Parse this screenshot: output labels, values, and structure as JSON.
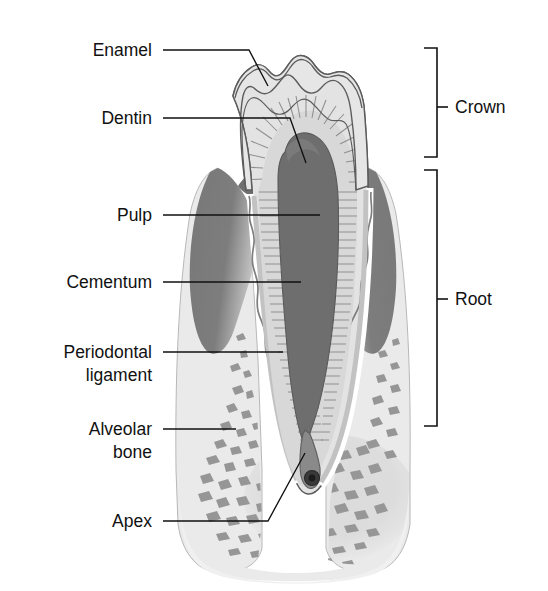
{
  "figure": {
    "type": "anatomical-diagram",
    "background_color": "#ffffff"
  },
  "labels_left": [
    {
      "id": "enamel",
      "text": "Enamel",
      "text_x": 152,
      "text_y": 56,
      "lines": []
    },
    {
      "id": "dentin",
      "text": "Dentin",
      "text_x": 152,
      "text_y": 124,
      "lines": []
    },
    {
      "id": "pulp",
      "text": "Pulp",
      "text_x": 152,
      "text_y": 221,
      "lines": []
    },
    {
      "id": "cementum",
      "text": "Cementum",
      "text_x": 152,
      "text_y": 288,
      "lines": []
    },
    {
      "id": "periodontal-ligament",
      "text": "Periodontal",
      "text_x": 152,
      "text_y": 358,
      "lines": [
        {
          "text": "ligament",
          "x": 152,
          "y": 381
        }
      ]
    },
    {
      "id": "alveolar-bone",
      "text": "Alveolar",
      "text_x": 152,
      "text_y": 435,
      "lines": [
        {
          "text": "bone",
          "x": 152,
          "y": 458
        }
      ]
    },
    {
      "id": "apex",
      "text": "Apex",
      "text_x": 152,
      "text_y": 527,
      "lines": []
    }
  ],
  "labels_right": [
    {
      "id": "crown",
      "text": "Crown",
      "text_x": 455,
      "text_y": 113
    },
    {
      "id": "root",
      "text": "Root",
      "text_x": 455,
      "text_y": 305
    }
  ],
  "brackets": [
    {
      "id": "crown-bracket",
      "top": 48,
      "bottom": 157,
      "x": 437,
      "tick_y": 107
    },
    {
      "id": "root-bracket",
      "top": 170,
      "bottom": 426,
      "x": 437,
      "tick_y": 299
    }
  ],
  "colors": {
    "outline": "#5c5c5c",
    "text": "#111111",
    "enamel": "#dddddd",
    "dentin": "#d2d2d2",
    "dentin_hatch": "#8f8f8f",
    "pulp": "#6e6e6e",
    "gingiva": "#7a7a7a",
    "gingiva_dark": "#6a6a6a",
    "bone": "#e7e7e7",
    "trabecula": "#8b8b8b",
    "cementum": "#c9c9c9",
    "pdl": "#9a9a9a",
    "canal": "#7d7d7d",
    "foramen": "#2e2e2e"
  },
  "structures": [
    {
      "id": "enamel-layer",
      "name": "Enamel",
      "region": "crown-outer"
    },
    {
      "id": "dentin-layer",
      "name": "Dentin",
      "region": "crown-and-root-body"
    },
    {
      "id": "pulp-chamber",
      "name": "Pulp",
      "region": "tooth-center"
    },
    {
      "id": "cementum-layer",
      "name": "Cementum",
      "region": "root-surface"
    },
    {
      "id": "periodontal-ligament",
      "name": "Periodontal ligament",
      "region": "root-socket-interface"
    },
    {
      "id": "alveolar-bone",
      "name": "Alveolar bone",
      "region": "surrounding-jaw"
    },
    {
      "id": "root-apex",
      "name": "Apex",
      "region": "root-tip"
    },
    {
      "id": "gingiva",
      "name": "Gingiva",
      "region": "gum-tissue"
    }
  ]
}
